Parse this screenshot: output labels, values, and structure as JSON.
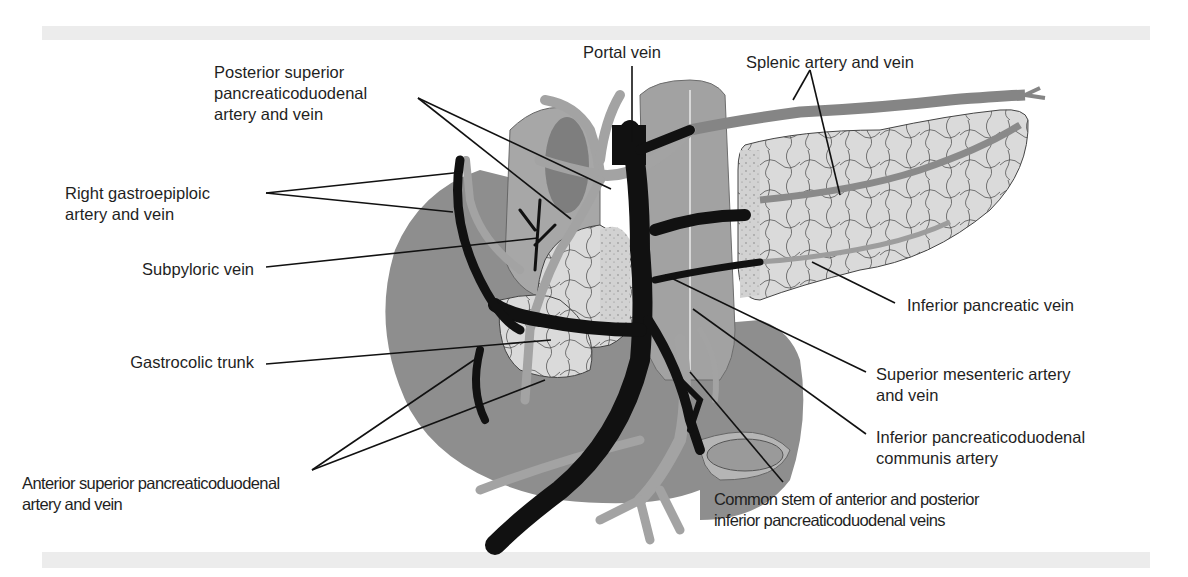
{
  "figure": {
    "type": "anatomical-illustration",
    "colors": {
      "veins": "#111111",
      "arteries": "#9a9a9a",
      "organ_fill": "#8c8c8c",
      "pancreas_fill": "#dcdcdc",
      "leader_lines": "#111111",
      "background": "#ffffff",
      "band": "#ececec"
    }
  },
  "labels": {
    "portal_vein": "Portal vein",
    "splenic": "Splenic artery and vein",
    "post_sup_pd": [
      "Posterior superior",
      "pancreaticoduodenal",
      "artery and vein"
    ],
    "right_gastroepiploic": [
      "Right gastroepiploic",
      "artery and vein"
    ],
    "subpyloric": "Subpyloric vein",
    "gastrocolic": "Gastrocolic trunk",
    "inferior_pancreatic": "Inferior pancreatic vein",
    "sma_smv": [
      "Superior mesenteric artery",
      "and vein"
    ],
    "inf_pd_communis": [
      "Inferior pancreaticoduodenal",
      "communis artery"
    ],
    "ant_sup_pd": [
      "Anterior superior pancreaticoduodenal",
      "artery and vein"
    ],
    "common_stem": [
      "Common stem of anterior and posterior",
      "inferior pancreaticoduodenal veins"
    ]
  }
}
